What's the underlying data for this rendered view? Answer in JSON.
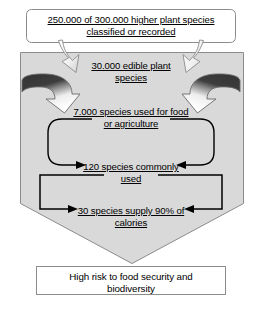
{
  "diagram": {
    "colors": {
      "funnel_fill": "#d9d9d9",
      "funnel_stroke": "#808080",
      "box_fill": "#ffffff",
      "box_stroke": "#808080",
      "text": "#000000",
      "arrow_dark": "#3b3b3b",
      "arrow_light": "#ffffff",
      "arrow_outline": "#595959",
      "loop_stroke": "#000000"
    },
    "top_box": {
      "line1": "250.000 of 300.000 higher plant species",
      "line2": "classified or recorded"
    },
    "funnel_stages": [
      {
        "id": "edible",
        "line1": "30.000 edible plant",
        "line2": "species"
      },
      {
        "id": "food-agriculture",
        "line1": "7.000 species used for food",
        "line2": "or agriculture"
      },
      {
        "id": "commonly-used",
        "line1": "120 species commonly",
        "line2": "used"
      },
      {
        "id": "calorie-supply",
        "line1": "30 species supply 90% of",
        "line2": "calories"
      }
    ],
    "bottom_box": {
      "line1": "High risk to food security and",
      "line2": "biodiversity"
    },
    "connectors": [
      {
        "name": "tapered-arrow-left",
        "direction": "down-right"
      },
      {
        "name": "tapered-arrow-right",
        "direction": "down-left"
      },
      {
        "name": "curved-block-arrow-left",
        "direction": "clockwise-inward"
      },
      {
        "name": "curved-block-arrow-right",
        "direction": "counterclockwise-inward"
      },
      {
        "name": "rounded-loop-connector",
        "direction": "inward-both"
      },
      {
        "name": "rectangular-loop-connector",
        "direction": "inward-both"
      }
    ]
  }
}
